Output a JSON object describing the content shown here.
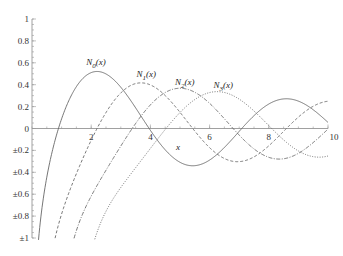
{
  "chart_data": {
    "type": "line",
    "title": "",
    "xlabel": "x",
    "ylabel": "",
    "xlim": [
      0,
      10
    ],
    "ylim": [
      -1,
      1
    ],
    "grid": false,
    "x_ticks": [
      {
        "value": 2,
        "label": "2"
      },
      {
        "value": 4,
        "label": "4"
      },
      {
        "value": 6,
        "label": "6"
      },
      {
        "value": 8,
        "label": "8"
      },
      {
        "value": 10,
        "label": "10"
      }
    ],
    "y_ticks": [
      {
        "value": 1,
        "label": "1"
      },
      {
        "value": 0.8,
        "label": "0.8"
      },
      {
        "value": 0.6,
        "label": "0.6"
      },
      {
        "value": 0.4,
        "label": "0.4"
      },
      {
        "value": 0.2,
        "label": "0.2"
      },
      {
        "value": 0,
        "label": "0"
      },
      {
        "value": -0.2,
        "label": "±0.2"
      },
      {
        "value": -0.4,
        "label": "±0.4"
      },
      {
        "value": -0.6,
        "label": "±0.6"
      },
      {
        "value": -0.8,
        "label": "±0.8"
      },
      {
        "value": -1,
        "label": "±1"
      }
    ],
    "series": [
      {
        "name": "N0(x)",
        "label_main": "N",
        "label_sub": "0",
        "label_arg": "(x)",
        "order": 0,
        "style": "solid",
        "label_at_x": 2.1,
        "label_at_y": 0.56,
        "values_sample": [
          [
            1,
            0.088
          ],
          [
            2,
            0.51
          ],
          [
            2.2,
            0.521
          ],
          [
            3,
            0.377
          ],
          [
            4,
            -0.017
          ],
          [
            5,
            -0.309
          ],
          [
            6,
            -0.288
          ],
          [
            7,
            -0.026
          ],
          [
            8,
            0.224
          ],
          [
            9,
            0.25
          ],
          [
            10,
            0.056
          ]
        ]
      },
      {
        "name": "N1(x)",
        "label_main": "N",
        "label_sub": "1",
        "label_arg": "(x)",
        "order": 1,
        "style": "dashed",
        "label_at_x": 3.8,
        "label_at_y": 0.45,
        "values_sample": [
          [
            1,
            -0.781
          ],
          [
            2,
            -0.107
          ],
          [
            3,
            0.325
          ],
          [
            3.7,
            0.417
          ],
          [
            4,
            0.398
          ],
          [
            5,
            0.148
          ],
          [
            6,
            -0.175
          ],
          [
            7,
            -0.303
          ],
          [
            8,
            -0.158
          ],
          [
            9,
            0.104
          ],
          [
            10,
            0.249
          ]
        ]
      },
      {
        "name": "N2(x)",
        "label_main": "N",
        "label_sub": "2",
        "label_arg": "(x)",
        "order": 2,
        "style": "dashdot",
        "label_at_x": 5.1,
        "label_at_y": 0.38,
        "values_sample": [
          [
            2,
            -0.617
          ],
          [
            3,
            -0.16
          ],
          [
            4,
            0.216
          ],
          [
            5,
            0.368
          ],
          [
            5.0,
            0.368
          ],
          [
            6,
            0.23
          ],
          [
            7,
            -0.06
          ],
          [
            8,
            -0.263
          ],
          [
            9,
            -0.226
          ],
          [
            10,
            0.006
          ]
        ]
      },
      {
        "name": "N3(x)",
        "label_main": "N",
        "label_sub": "3",
        "label_arg": "(x)",
        "order": 3,
        "style": "dotted",
        "label_at_x": 6.4,
        "label_at_y": 0.35,
        "values_sample": [
          [
            3,
            -0.538
          ],
          [
            4,
            -0.182
          ],
          [
            5,
            0.146
          ],
          [
            6,
            0.328
          ],
          [
            6.4,
            0.33
          ],
          [
            7,
            0.268
          ],
          [
            8,
            0.025
          ],
          [
            9,
            -0.21
          ],
          [
            10,
            -0.252
          ]
        ]
      }
    ]
  }
}
